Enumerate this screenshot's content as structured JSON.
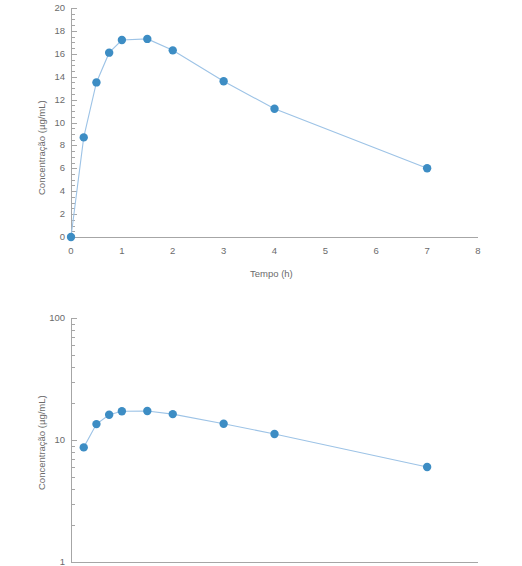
{
  "figure": {
    "background": "#ffffff",
    "accent_color": "#3d8dc4",
    "line_color": "#9dc3e6",
    "axis_color": "#a6a6a6",
    "text_color": "#6b6b6b"
  },
  "chart_data": [
    {
      "type": "line",
      "id": "linear-concentration-time",
      "title": "",
      "xlabel": "Tempo (h)",
      "ylabel": "Concentração (µg/mL)",
      "xlim": [
        0,
        8
      ],
      "ylim": [
        0,
        20
      ],
      "xscale": "linear",
      "yscale": "linear",
      "grid": false,
      "legend": false,
      "xticks": [
        0,
        1,
        2,
        3,
        4,
        5,
        6,
        7,
        8
      ],
      "xtick_labels": [
        "0",
        "1",
        "2",
        "3",
        "4",
        "5",
        "6",
        "7",
        "8"
      ],
      "yticks": [
        0,
        2,
        4,
        6,
        8,
        10,
        12,
        14,
        16,
        18,
        20
      ],
      "ytick_labels": [
        "0",
        "2",
        "4",
        "6",
        "8",
        "10",
        "12",
        "14",
        "16",
        "18",
        "20"
      ],
      "minor_ytick_step": 0.5,
      "x": [
        0,
        0.25,
        0.5,
        0.75,
        1,
        1.5,
        2,
        3,
        4,
        7
      ],
      "values": [
        0,
        8.7,
        13.5,
        16.1,
        17.2,
        17.3,
        16.3,
        13.6,
        11.2,
        6.0
      ]
    },
    {
      "type": "line",
      "id": "semilog-concentration-time",
      "title": "",
      "xlabel": "",
      "ylabel": "Concentração (µg/mL)",
      "xlim": [
        0,
        8
      ],
      "ylim": [
        1,
        100
      ],
      "xscale": "linear",
      "yscale": "log",
      "grid": false,
      "legend": false,
      "cropped": "x-axis not visible in frame",
      "yticks": [
        1,
        10,
        100
      ],
      "ytick_labels": [
        "1",
        "10",
        "100"
      ],
      "x": [
        0.25,
        0.5,
        0.75,
        1,
        1.5,
        2,
        3,
        4,
        7
      ],
      "values": [
        8.7,
        13.5,
        16.1,
        17.2,
        17.3,
        16.3,
        13.6,
        11.2,
        6.0
      ]
    }
  ]
}
